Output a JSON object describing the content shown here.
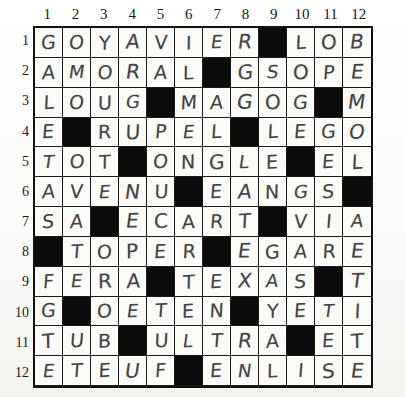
{
  "puzzle": {
    "title": "crossword-grid",
    "columns": 12,
    "rows": 12,
    "block_char": "#",
    "column_headers": [
      "1",
      "2",
      "3",
      "4",
      "5",
      "6",
      "7",
      "8",
      "9",
      "10",
      "11",
      "12"
    ],
    "row_headers": [
      "1",
      "2",
      "3",
      "4",
      "5",
      "6",
      "7",
      "8",
      "9",
      "10",
      "11",
      "12"
    ],
    "colors": {
      "block": "#0b0b0b",
      "cell": "#fbfbf8",
      "grid_line": "#1a1a1a",
      "ink": "#2b2b2e",
      "number": "#18181a"
    },
    "grid": [
      [
        "G",
        "O",
        "Y",
        "A",
        "V",
        "I",
        "E",
        "R",
        "#",
        "L",
        "O",
        "B"
      ],
      [
        "A",
        "M",
        "O",
        "R",
        "A",
        "L",
        "#",
        "G",
        "S",
        "O",
        "P",
        "E"
      ],
      [
        "L",
        "O",
        "U",
        "G",
        "#",
        "M",
        "A",
        "G",
        "O",
        "G",
        "#",
        "M"
      ],
      [
        "E",
        "#",
        "R",
        "U",
        "P",
        "E",
        "L",
        "#",
        "L",
        "E",
        "G",
        "O"
      ],
      [
        "T",
        "O",
        "T",
        "#",
        "O",
        "N",
        "G",
        "L",
        "E",
        "#",
        "E",
        "L"
      ],
      [
        "A",
        "V",
        "E",
        "N",
        "U",
        "#",
        "E",
        "A",
        "N",
        "G",
        "S",
        "#"
      ],
      [
        "S",
        "A",
        "#",
        "E",
        "C",
        "A",
        "R",
        "T",
        "#",
        "V",
        "I",
        "A"
      ],
      [
        "#",
        "T",
        "O",
        "P",
        "E",
        "R",
        "#",
        "E",
        "G",
        "A",
        "R",
        "E"
      ],
      [
        "F",
        "E",
        "R",
        "A",
        "#",
        "T",
        "E",
        "X",
        "A",
        "S",
        "#",
        "T"
      ],
      [
        "G",
        "#",
        "O",
        "E",
        "T",
        "E",
        "N",
        "#",
        "Y",
        "E",
        "T",
        "I"
      ],
      [
        "T",
        "U",
        "B",
        "#",
        "U",
        "L",
        "T",
        "R",
        "A",
        "#",
        "E",
        "T"
      ],
      [
        "E",
        "T",
        "E",
        "U",
        "F",
        "#",
        "E",
        "N",
        "L",
        "I",
        "S",
        "E"
      ]
    ],
    "rows_as_words": [
      "GOYAVIER#LOB",
      "AMORAL#GSOPE",
      "LOUG#MAGOG#M",
      "E#RUPEL#LEGO",
      "TOT#ONGLE#EL",
      "AVENU#EANGS#",
      "SA#ECART#VIA",
      "#TOPER#EGARE",
      "FERA#TEXAS#T",
      "G#OETEN#YETI",
      "TUB#ULTRA#ET",
      "ETEUF#ENLISE"
    ]
  }
}
